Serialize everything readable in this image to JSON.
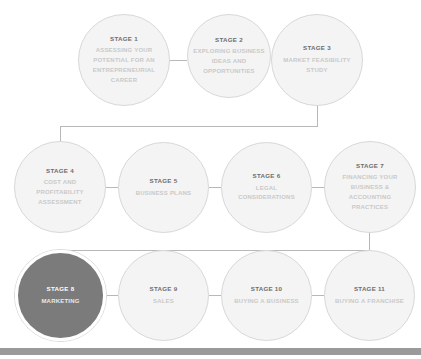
{
  "diagram": {
    "type": "flowchart",
    "colors": {
      "node_fill": "#f4f4f4",
      "node_border": "#d8d8d8",
      "active_fill": "#7b7b7b",
      "active_ring": "#ffffff",
      "title_text": "#6e6e6e",
      "desc_text": "#c9c9c9",
      "active_text": "#ffffff",
      "connector": "#b8b8b8",
      "bottom_bar": "#9a9a9a",
      "background": "#ffffff"
    },
    "rows": [
      {
        "row_index": 0,
        "nodes": [
          {
            "id": "stage-1",
            "title": "STAGE 1",
            "desc": "ASSESSING YOUR POTENTIAL FOR AN ENTREPRENEURIAL CAREER",
            "active": false
          },
          {
            "id": "stage-2",
            "title": "STAGE 2",
            "desc": "EXPLORING BUSINESS IDEAS AND OPPORTUNITIES",
            "active": false
          },
          {
            "id": "stage-3",
            "title": "STAGE 3",
            "desc": "MARKET FEASIBILITY STUDY",
            "active": false
          }
        ]
      },
      {
        "row_index": 1,
        "nodes": [
          {
            "id": "stage-4",
            "title": "STAGE 4",
            "desc": "COST AND PROFITABILITY ASSESSMENT",
            "active": false
          },
          {
            "id": "stage-5",
            "title": "STAGE 5",
            "desc": "BUSINESS PLANS",
            "active": false
          },
          {
            "id": "stage-6",
            "title": "STAGE 6",
            "desc": "LEGAL CONSIDERATIONS",
            "active": false
          },
          {
            "id": "stage-7",
            "title": "STAGE 7",
            "desc": "FINANCING YOUR BUSINESS & ACCOUNTING PRACTICES",
            "active": false
          }
        ]
      },
      {
        "row_index": 2,
        "nodes": [
          {
            "id": "stage-8",
            "title": "STAGE 8",
            "desc": "MARKETING",
            "active": true
          },
          {
            "id": "stage-9",
            "title": "STAGE 9",
            "desc": "SALES",
            "active": false
          },
          {
            "id": "stage-10",
            "title": "STAGE 10",
            "desc": "BUYING A BUSINESS",
            "active": false
          },
          {
            "id": "stage-11",
            "title": "STAGE 11",
            "desc": "BUYING A FRANCHISE",
            "active": false
          }
        ]
      }
    ]
  }
}
